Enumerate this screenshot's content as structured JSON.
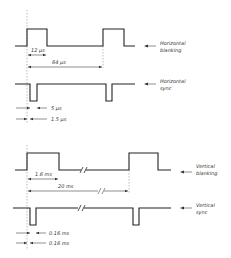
{
  "diagram": {
    "type": "timing-diagram",
    "panels": [
      {
        "id": "horizontal",
        "signals": [
          {
            "name": "Horizontal blanking",
            "label_line1": "Horizontal",
            "label_line2": "blanking",
            "polarity": "positive"
          },
          {
            "name": "Horizontal sync",
            "label_line1": "Horizontal",
            "label_line2": "sync",
            "polarity": "negative"
          }
        ],
        "dimensions": {
          "blanking_width": "12 µs",
          "line_period": "64 µs",
          "sync_width": "5 µs",
          "front_porch": "1.5 µs"
        }
      },
      {
        "id": "vertical",
        "signals": [
          {
            "name": "Vertical blanking",
            "label_line1": "Vertical",
            "label_line2": "blanking",
            "polarity": "positive"
          },
          {
            "name": "Vertical sync",
            "label_line1": "Vertical",
            "label_line2": "sync",
            "polarity": "negative"
          }
        ],
        "dimensions": {
          "blanking_width": "1.6 ms",
          "field_period": "20 ms",
          "sync_width": "0.16 ms",
          "front_porch": "0.16 ms"
        }
      }
    ],
    "colors": {
      "line": "#222222",
      "text": "#333333",
      "background": "#ffffff"
    }
  }
}
